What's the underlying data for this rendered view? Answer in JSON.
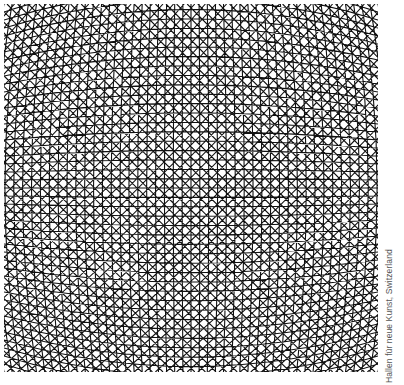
{
  "artwork": {
    "description": "Black-and-white op-art moiré lattice of curved intersecting lines converging toward a horizontal central band",
    "ink_color": "#111111",
    "paper_color": "#ffffff"
  },
  "caption": "Hallen für neue Kunst, Switzerland"
}
